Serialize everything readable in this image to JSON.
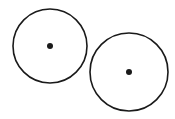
{
  "canvas": {
    "width": 175,
    "height": 119,
    "background": "#ffffff"
  },
  "stroke_color": "#1a1a1a",
  "circles": [
    {
      "name": "left-circle",
      "cx": 50,
      "cy": 46,
      "r": 37,
      "center_dot_r": 3
    },
    {
      "name": "right-circle",
      "cx": 129,
      "cy": 72,
      "r": 39,
      "center_dot_r": 3
    }
  ]
}
